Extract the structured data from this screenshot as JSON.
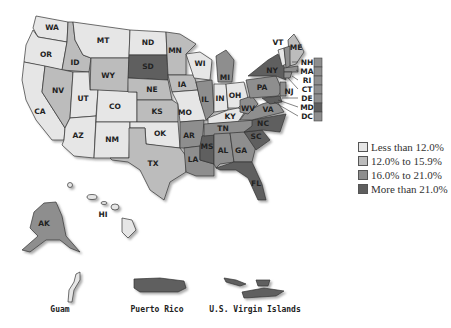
{
  "colors": {
    "cat1": "#e6e6e6",
    "cat2": "#bcbcbc",
    "cat3": "#8e8e8e",
    "cat4": "#5e5e5e"
  },
  "legend": {
    "items": [
      {
        "label": "Less than 12.0%",
        "category": "cat1"
      },
      {
        "label": "12.0% to 15.9%",
        "category": "cat2"
      },
      {
        "label": "16.0% to 21.0%",
        "category": "cat3"
      },
      {
        "label": "More than 21.0%",
        "category": "cat4"
      }
    ]
  },
  "states": {
    "WA": "WA",
    "OR": "OR",
    "CA": "CA",
    "ID": "ID",
    "NV": "NV",
    "MT": "MT",
    "WY": "WY",
    "UT": "UT",
    "AZ": "AZ",
    "CO": "CO",
    "NM": "NM",
    "ND": "ND",
    "SD": "SD",
    "NE": "NE",
    "KS": "KS",
    "OK": "OK",
    "TX": "TX",
    "MN": "MN",
    "IA": "IA",
    "MO": "MO",
    "AR": "AR",
    "LA": "LA",
    "WI": "WI",
    "IL": "IL",
    "MS": "MS",
    "MI": "MI",
    "IN": "IN",
    "OH": "OH",
    "KY": "KY",
    "TN": "TN",
    "AL": "AL",
    "GA": "GA",
    "FL": "FL",
    "SC": "SC",
    "NC": "NC",
    "VA": "VA",
    "WV": "WV",
    "PA": "PA",
    "NY": "NY",
    "VT": "VT",
    "ME": "ME",
    "NJ": "NJ",
    "AK": "AK",
    "HI": "HI"
  },
  "small_states": [
    {
      "label": "NH"
    },
    {
      "label": "MA"
    },
    {
      "label": "RI"
    },
    {
      "label": "CT"
    },
    {
      "label": "DE"
    },
    {
      "label": "MD"
    },
    {
      "label": "DC"
    }
  ],
  "territories": {
    "guam": "Guam",
    "puerto_rico": "Puerto Rico",
    "usvi": "U.S. Virgin Islands"
  }
}
